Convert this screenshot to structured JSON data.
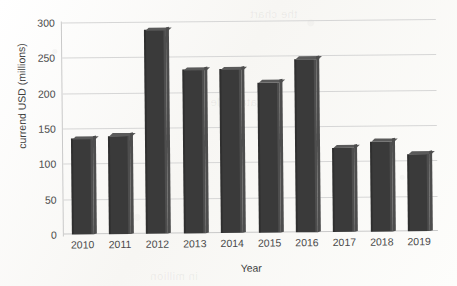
{
  "chart_data": {
    "type": "bar",
    "title": "",
    "xlabel": "Year",
    "ylabel": "currend USD (millions)",
    "categories": [
      "2010",
      "2011",
      "2012",
      "2013",
      "2014",
      "2015",
      "2016",
      "2017",
      "2018",
      "2019"
    ],
    "values": [
      136,
      140,
      290,
      233,
      233,
      214,
      246,
      120,
      128,
      110
    ],
    "ylim": [
      0,
      300
    ],
    "yticks": [
      0,
      50,
      100,
      150,
      200,
      250,
      300
    ],
    "ytick_labels": [
      "0",
      "50",
      "100",
      "150",
      "200",
      "250",
      "300"
    ],
    "grid": true,
    "legend": "none",
    "series": [
      {
        "name": "currend USD (millions)",
        "color": "#3a3a3a",
        "values": [
          136,
          140,
          290,
          233,
          233,
          214,
          246,
          120,
          128,
          110
        ]
      }
    ]
  },
  "colors": {
    "bar": "#3a3a3a",
    "bar_highlight": "#5a5a5a",
    "gridline": "#d6d6d6",
    "axis": "#c9c9c9",
    "text": "#4a4a4a",
    "background": "#fbfbf9"
  },
  "ghost_text": {
    "g1": "the chart",
    "g2": "data table",
    "g3": "in million"
  }
}
